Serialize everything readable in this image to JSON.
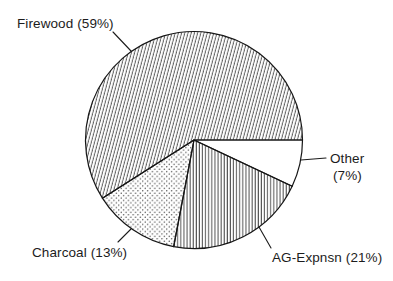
{
  "chart_data": {
    "type": "pie",
    "title": "",
    "unit": "%",
    "labels": [
      "Firewood",
      "Charcoal",
      "AG-Expnsn",
      "Other"
    ],
    "values": [
      59,
      13,
      21,
      7
    ],
    "start_angle_deg": 0,
    "direction": "clockwise",
    "legend_position": "callout-labels",
    "slices": [
      {
        "label": "Other",
        "value": 7,
        "pattern": "none",
        "display_label": "Other (7%)"
      },
      {
        "label": "AG-Expnsn",
        "value": 21,
        "pattern": "vertical-lines",
        "display_label": "AG-Expnsn (21%)"
      },
      {
        "label": "Charcoal",
        "value": 13,
        "pattern": "dots",
        "display_label": "Charcoal (13%)"
      },
      {
        "label": "Firewood",
        "value": 59,
        "pattern": "diagonal-hatch",
        "display_label": "Firewood (59%)"
      }
    ]
  },
  "callouts": {
    "firewood": "Firewood (59%)",
    "charcoal": "Charcoal (13%)",
    "ag_expnsn": "AG-Expnsn (21%)",
    "other_line1": "Other",
    "other_line2": "(7%)"
  },
  "colors": {
    "ink": "#1c1c1c",
    "hatch": "#3a3a3a",
    "background": "#ffffff"
  }
}
